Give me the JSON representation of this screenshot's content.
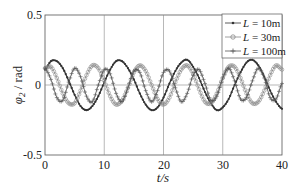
{
  "chart_data": {
    "type": "line",
    "title": "",
    "xlabel": "t/s",
    "ylabel": "φ2 / rad",
    "xlim": [
      0,
      40
    ],
    "ylim": [
      -0.5,
      0.5
    ],
    "xticks": [
      "0",
      "10",
      "20",
      "30",
      "40"
    ],
    "yticks": [
      "0.5",
      "0",
      "-0.5"
    ],
    "grid": "vertical lines at x ticks, horizontal line at y=0",
    "legend_position": "upper right",
    "series": [
      {
        "name": "L = 10m",
        "marker": "dot",
        "color": "#333333",
        "amplitude": 0.18,
        "period_s": 10.2,
        "first_peak_t": 1.5,
        "x": [
          0,
          1,
          2,
          3,
          4,
          5,
          6,
          7,
          8,
          9,
          10,
          11,
          12,
          13,
          14,
          15,
          16,
          17,
          18,
          19,
          20,
          21,
          22,
          23,
          24,
          25,
          26,
          27,
          28,
          29,
          30,
          31,
          32,
          33,
          34,
          35,
          36,
          37,
          38,
          39,
          40
        ],
        "values": [
          0.11,
          0.17,
          0.17,
          0.12,
          0.03,
          -0.07,
          -0.15,
          -0.18,
          -0.15,
          -0.08,
          0.02,
          0.11,
          0.17,
          0.17,
          0.12,
          0.04,
          -0.06,
          -0.14,
          -0.18,
          -0.16,
          -0.09,
          0.01,
          0.1,
          0.16,
          0.18,
          0.13,
          0.05,
          -0.05,
          -0.13,
          -0.18,
          -0.16,
          -0.1,
          0.0,
          0.09,
          0.16,
          0.18,
          0.14,
          0.06,
          -0.04,
          -0.12,
          -0.17
        ]
      },
      {
        "name": "L = 30m",
        "marker": "circle",
        "color": "#888888",
        "amplitude": 0.14,
        "period_s": 7.2,
        "x": [
          0,
          1,
          2,
          3,
          4,
          5,
          6,
          7,
          8,
          9,
          10,
          11,
          12,
          13,
          14,
          15,
          16,
          17,
          18,
          19,
          20,
          21,
          22,
          23,
          24,
          25,
          26,
          27,
          28,
          29,
          30,
          31,
          32,
          33,
          34,
          35,
          36,
          37,
          38,
          39,
          40
        ],
        "values": [
          0.12,
          0.13,
          0.05,
          -0.06,
          -0.13,
          -0.13,
          -0.04,
          0.07,
          0.14,
          0.12,
          0.03,
          -0.08,
          -0.14,
          -0.11,
          -0.02,
          0.09,
          0.14,
          0.1,
          0.0,
          -0.1,
          -0.14,
          -0.09,
          0.02,
          0.11,
          0.14,
          0.08,
          -0.03,
          -0.12,
          -0.13,
          -0.06,
          0.05,
          0.13,
          0.13,
          0.05,
          -0.06,
          -0.13,
          -0.12,
          -0.04,
          0.07,
          0.14,
          0.11
        ]
      },
      {
        "name": "L = 100m",
        "marker": "plus",
        "color": "#555555",
        "amplitude": 0.12,
        "period_s": 5.2,
        "x": [
          0,
          1,
          2,
          3,
          4,
          5,
          6,
          7,
          8,
          9,
          10,
          11,
          12,
          13,
          14,
          15,
          16,
          17,
          18,
          19,
          20,
          21,
          22,
          23,
          24,
          25,
          26,
          27,
          28,
          29,
          30,
          31,
          32,
          33,
          34,
          35,
          36,
          37,
          38,
          39,
          40
        ],
        "values": [
          0.12,
          0.04,
          -0.09,
          -0.11,
          0.02,
          0.12,
          0.06,
          -0.08,
          -0.12,
          0.0,
          0.11,
          0.08,
          -0.06,
          -0.12,
          -0.02,
          0.1,
          0.09,
          -0.04,
          -0.12,
          -0.04,
          0.09,
          0.1,
          -0.02,
          -0.12,
          -0.06,
          0.07,
          0.11,
          0.01,
          -0.11,
          -0.08,
          0.05,
          0.12,
          0.03,
          -0.1,
          -0.09,
          0.03,
          0.12,
          0.05,
          -0.09,
          -0.1,
          0.01
        ]
      }
    ]
  },
  "axes": {
    "y_label_main": "φ",
    "y_label_sub": "2",
    "y_label_unit": " / rad",
    "x_label": "t/s",
    "yticks": [
      {
        "label": "0.5",
        "value": 0.5
      },
      {
        "label": "0",
        "value": 0
      },
      {
        "label": "-0.5",
        "value": -0.5
      }
    ],
    "xticks": [
      {
        "label": "0",
        "value": 0
      },
      {
        "label": "10",
        "value": 10
      },
      {
        "label": "20",
        "value": 20
      },
      {
        "label": "30",
        "value": 30
      },
      {
        "label": "40",
        "value": 40
      }
    ]
  },
  "legend": {
    "items": [
      {
        "prefix": "L",
        "text": " = 10m"
      },
      {
        "prefix": "L",
        "text": " = 30m"
      },
      {
        "prefix": "L",
        "text": " = 100m"
      }
    ]
  }
}
